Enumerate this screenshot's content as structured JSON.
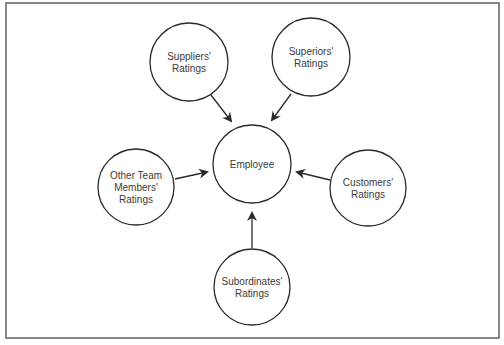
{
  "diagram": {
    "type": "hub-and-spoke",
    "frame": {
      "x": 6,
      "y": 3,
      "w": 493,
      "h": 335,
      "stroke": "#6a6a6a"
    },
    "colors": {
      "stroke": "#2a2a2a",
      "text": "#3a3a3a",
      "background": "#ffffff"
    },
    "center": {
      "id": "employee",
      "lines": [
        "Employee"
      ],
      "cx": 252,
      "cy": 164,
      "r": 39
    },
    "nodes": [
      {
        "id": "suppliers",
        "lines": [
          "Suppliers'",
          "Ratings"
        ],
        "cx": 189,
        "cy": 62,
        "r": 39,
        "arrow": {
          "x1": 211,
          "y1": 95,
          "x2": 231,
          "y2": 121
        }
      },
      {
        "id": "superiors",
        "lines": [
          "Superiors'",
          "Ratings"
        ],
        "cx": 311,
        "cy": 57,
        "r": 39,
        "arrow": {
          "x1": 291,
          "y1": 94,
          "x2": 272,
          "y2": 120
        }
      },
      {
        "id": "other-team-members",
        "lines": [
          "Other Team",
          "Members'",
          "Ratings"
        ],
        "cx": 136,
        "cy": 187,
        "r": 38,
        "arrow": {
          "x1": 175,
          "y1": 179,
          "x2": 207,
          "y2": 172
        }
      },
      {
        "id": "customers",
        "lines": [
          "Customers'",
          "Ratings"
        ],
        "cx": 368,
        "cy": 188,
        "r": 38,
        "arrow": {
          "x1": 330,
          "y1": 180,
          "x2": 297,
          "y2": 172
        }
      },
      {
        "id": "subordinates",
        "lines": [
          "Subordinates'",
          "Ratings"
        ],
        "cx": 252,
        "cy": 287,
        "r": 38,
        "arrow": {
          "x1": 252,
          "y1": 248,
          "x2": 252,
          "y2": 213
        }
      }
    ]
  }
}
